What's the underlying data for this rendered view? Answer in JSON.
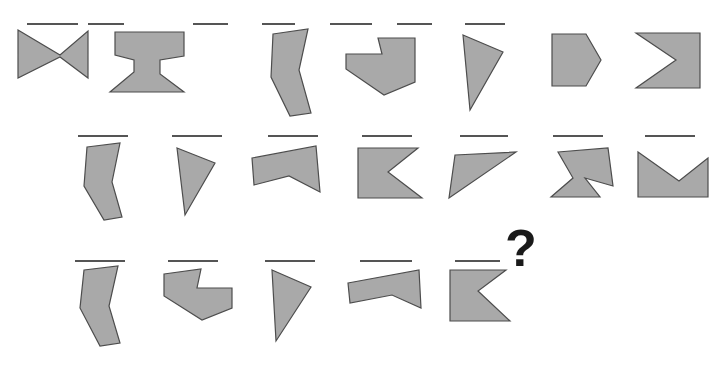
{
  "canvas": {
    "width": 721,
    "height": 365,
    "background": "#ffffff"
  },
  "style": {
    "shape_fill": "#a9a9a9",
    "shape_stroke": "#4d4d4d",
    "rule_stroke": "#555555",
    "question_color": "#1a1a1a"
  },
  "puzzle": {
    "kind": "visual-analogy-matrix",
    "missing_cell_marker": "?",
    "rows": 3,
    "row_counts": [
      7,
      7,
      5
    ]
  },
  "question_mark": {
    "glyph": "?",
    "x": 505,
    "y": 266
  },
  "rows": [
    {
      "name": "row-1",
      "rule_y": 24,
      "cells": [
        {
          "name": "cell-r1c1",
          "shape_name": "bowtie-horizontal",
          "rule": [
            27,
            78
          ],
          "points": "18,30 60,55 88,31 88,78 60,57 18,78"
        },
        {
          "name": "cell-r1c2",
          "shape_name": "i-beam-hourglass",
          "rule": [
            88,
            124
          ],
          "points": "115,32 184,32 184,56 160,60 160,74 184,92 110,92 134,72 134,60 115,55"
        },
        {
          "name": "cell-r1c3",
          "shape_name": "bent-vertical-bar",
          "rule": [
            193,
            228
          ],
          "points": "273,34 308,29 299,70 311,113 290,116 271,77"
        },
        {
          "name": "cell-r1c4",
          "shape_name": "notched-arrow-right",
          "rule": [
            262,
            295
          ],
          "points": "378,38 415,38 415,82 384,95 346,69 346,54 382,54"
        },
        {
          "name": "cell-r1c5",
          "shape_name": "right-triangle-tall",
          "rule": [
            330,
            372
          ],
          "points": "463,35 503,52 470,110"
        },
        {
          "name": "cell-r1c6",
          "shape_name": "pentagon-rounded-right",
          "rule": [
            397,
            432
          ],
          "points": "552,34 586,34 601,60 586,86 552,86"
        },
        {
          "name": "cell-r1c7",
          "shape_name": "chevron-right-solid",
          "rule": [
            465,
            505
          ],
          "points": "636,33 700,33 700,88 636,88 676,60"
        }
      ]
    },
    {
      "name": "row-2",
      "rule_y": 136,
      "cells": [
        {
          "name": "cell-r2c1",
          "shape_name": "bent-vertical-bar",
          "rule": [
            78,
            128
          ],
          "points": "87,147 120,143 112,182 122,217 104,220 84,186"
        },
        {
          "name": "cell-r2c2",
          "shape_name": "right-triangle-tall",
          "rule": [
            172,
            222
          ],
          "points": "177,148 215,163 185,215"
        },
        {
          "name": "cell-r2c3",
          "shape_name": "flat-chevron-up",
          "rule": [
            268,
            318
          ],
          "points": "252,158 316,146 320,192 289,176 254,185"
        },
        {
          "name": "cell-r2c4",
          "shape_name": "chevron-left-solid",
          "rule": [
            362,
            412
          ],
          "points": "358,148 418,148 388,172 422,198 358,198"
        },
        {
          "name": "cell-r2c5",
          "shape_name": "thin-diagonal-sliver",
          "rule": [
            460,
            508
          ],
          "points": "455,155 516,152 449,198"
        },
        {
          "name": "cell-r2c6",
          "shape_name": "trapezoid-with-notch",
          "rule": [
            553,
            603
          ],
          "points": "558,152 608,148 613,186 585,178 600,197 551,197 573,178"
        },
        {
          "name": "cell-r2c7",
          "shape_name": "envelope-v-notch",
          "rule": [
            645,
            695
          ],
          "points": "638,152 679,181 708,158 708,197 638,197"
        }
      ]
    },
    {
      "name": "row-3",
      "rule_y": 261,
      "cells": [
        {
          "name": "cell-r3c1",
          "shape_name": "bent-vertical-bar",
          "rule": [
            75,
            125
          ],
          "points": "84,270 118,266 109,306 120,343 100,346 80,308"
        },
        {
          "name": "cell-r3c2",
          "shape_name": "notched-arrow-left",
          "rule": [
            168,
            218
          ],
          "points": "164,274 201,269 197,288 232,288 232,308 202,320 164,296"
        },
        {
          "name": "cell-r3c3",
          "shape_name": "right-triangle-tall",
          "rule": [
            265,
            315
          ],
          "points": "272,270 311,287 276,341"
        },
        {
          "name": "cell-r3c4",
          "shape_name": "flat-chevron-up",
          "rule": [
            360,
            412
          ],
          "points": "348,283 419,270 421,308 392,295 350,303"
        },
        {
          "name": "cell-r3c5",
          "shape_name": "chevron-left-solid",
          "rule": [
            455,
            500
          ],
          "points": "450,270 506,270 478,291 510,321 450,321"
        }
      ]
    }
  ]
}
